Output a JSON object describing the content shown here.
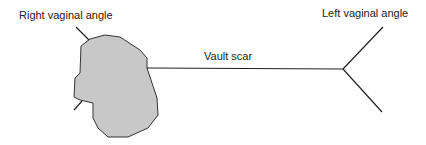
{
  "labels": {
    "right_angle": "Right vaginal angle",
    "left_angle": "Left vaginal angle",
    "vault_scar": "Vault scar"
  },
  "colors": {
    "blob_fill": "#c8c8c8",
    "stroke": "#222222"
  }
}
